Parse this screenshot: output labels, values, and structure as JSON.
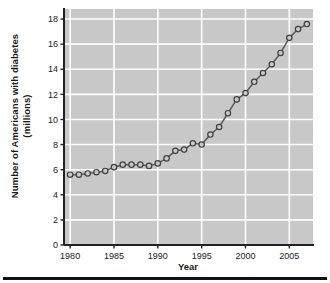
{
  "chart_data": {
    "type": "line",
    "title": "",
    "xlabel": "Year",
    "ylabel": "Number of Americans with diabetes (millions)",
    "ylabel_line1": "Number of Americans with diabetes",
    "ylabel_line2": "(millions)",
    "xlim": [
      1979.3,
      2007.7
    ],
    "ylim": [
      0,
      18.8
    ],
    "xticks": [
      1980,
      1985,
      1990,
      1995,
      2000,
      2005
    ],
    "xtick_labels": [
      "1980",
      "1985",
      "1990",
      "1995",
      "2000",
      "2005"
    ],
    "yticks": [
      0,
      2,
      4,
      6,
      8,
      10,
      12,
      14,
      16,
      18
    ],
    "ytick_labels": [
      "0",
      "2",
      "4",
      "6",
      "8",
      "10",
      "12",
      "14",
      "16",
      "18"
    ],
    "grid": true,
    "grid_color": "#ffffff",
    "plot_background": "#c8c8c8",
    "legend": null,
    "marker": "open-circle",
    "line_color": "#5a5a5a",
    "marker_edge_color": "#404040",
    "marker_face_color": "#c8c8c8",
    "x": [
      1980,
      1981,
      1982,
      1983,
      1984,
      1985,
      1986,
      1987,
      1988,
      1989,
      1990,
      1991,
      1992,
      1993,
      1994,
      1995,
      1996,
      1997,
      1998,
      1999,
      2000,
      2001,
      2002,
      2003,
      2004,
      2005,
      2006,
      2007
    ],
    "values": [
      5.6,
      5.6,
      5.7,
      5.8,
      5.9,
      6.2,
      6.4,
      6.4,
      6.4,
      6.3,
      6.5,
      6.9,
      7.5,
      7.6,
      8.1,
      8.0,
      8.8,
      9.4,
      10.5,
      11.6,
      12.1,
      13.0,
      13.7,
      14.4,
      15.3,
      16.5,
      17.2,
      17.6
    ],
    "series": [
      {
        "name": "Number of Americans with diabetes (millions)",
        "values": [
          5.6,
          5.6,
          5.7,
          5.8,
          5.9,
          6.2,
          6.4,
          6.4,
          6.4,
          6.3,
          6.5,
          6.9,
          7.5,
          7.6,
          8.1,
          8.0,
          8.8,
          9.4,
          10.5,
          11.6,
          12.1,
          13.0,
          13.7,
          14.4,
          15.3,
          16.5,
          17.2,
          17.6
        ]
      }
    ]
  }
}
